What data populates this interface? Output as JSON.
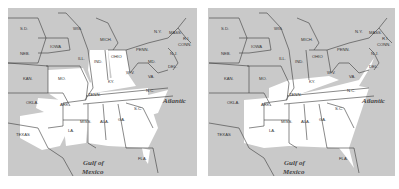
{
  "colors": {
    "land_gray": "#c9c9c9",
    "highlight": "#ffffff",
    "border": "#3a3a3a",
    "label": "#333333"
  },
  "water_labels": {
    "atlantic": "Atlantic",
    "gulf_line1": "Gulf of",
    "gulf_line2": "Mexico"
  },
  "states": {
    "sd": "S.D.",
    "neb": "NEB.",
    "kan": "KAN.",
    "okla": "OKLA.",
    "texas": "TEXAS",
    "iowa": "IOWA",
    "mo": "MO.",
    "ark": "ARK.",
    "la": "LA.",
    "wis": "WIS.",
    "ill": "ILL.",
    "mich": "MICH.",
    "ind": "IND.",
    "ohio": "OHIO",
    "ky": "KY.",
    "tenn": "TENN.",
    "miss": "MISS.",
    "ala": "ALA.",
    "ga": "GA.",
    "fla": "FLA.",
    "sc": "S.C.",
    "nc": "N.C.",
    "va": "VA.",
    "wv": "W.V.",
    "md": "MD.",
    "del": "DEL.",
    "penn": "PENN.",
    "nj": "N.J.",
    "ny": "N.Y.",
    "conn": "CONN.",
    "ri": "R.I.",
    "mass": "MASS.",
    "vt": "VT.",
    "nh": "N.H."
  },
  "panels": [
    {
      "id": "left",
      "highlighted_region": "Texas, Oklahoma, Missouri, Illinois-Indiana-Ohio, Kentucky, Tennessee, Deep South, Carolinas"
    },
    {
      "id": "right",
      "highlighted_region": "Southeast: Arkansas, Louisiana, Tennessee, Kentucky, Virginia, Carolinas, Georgia, Alabama, Mississippi"
    }
  ]
}
